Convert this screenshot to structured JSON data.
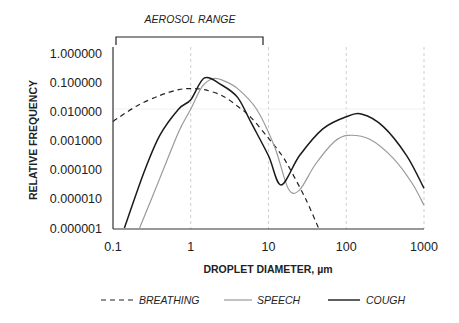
{
  "chart_data": {
    "type": "line",
    "title": "",
    "annotation": "AEROSOL RANGE",
    "annotation_range": [
      0.1,
      10
    ],
    "xlabel": "DROPLET DIAMETER,  µm",
    "ylabel": "RELATIVE FREQUENCY",
    "xscale": "log",
    "yscale": "log",
    "xlim": [
      0.1,
      1000
    ],
    "ylim": [
      1e-06,
      1
    ],
    "x_ticks": [
      0.1,
      1,
      10,
      100,
      1000
    ],
    "x_tick_labels": [
      "0.1",
      "1",
      "10",
      "100",
      "1000"
    ],
    "y_ticks": [
      1,
      0.1,
      0.01,
      0.001,
      0.0001,
      1e-05,
      1e-06
    ],
    "y_tick_labels": [
      "1.000000",
      "0.100000",
      "0.010000",
      "0.001000",
      "0.000100",
      "0.000010",
      "0.000001"
    ],
    "grid": "vertical dashed at decades",
    "legend_position": "bottom",
    "series": [
      {
        "name": "BREATHING",
        "style": "dashed",
        "color": "#222222",
        "points": [
          [
            0.1,
            0.0045
          ],
          [
            0.2,
            0.015
          ],
          [
            0.4,
            0.035
          ],
          [
            0.7,
            0.055
          ],
          [
            1.0,
            0.06
          ],
          [
            1.5,
            0.055
          ],
          [
            2.5,
            0.035
          ],
          [
            4,
            0.015
          ],
          [
            6,
            0.006
          ],
          [
            10,
            0.0012
          ],
          [
            15,
            0.0003
          ],
          [
            20,
            8e-05
          ],
          [
            30,
            1e-05
          ],
          [
            44,
            1e-06
          ]
        ]
      },
      {
        "name": "SPEECH",
        "style": "solid",
        "color": "#9a9a9a",
        "points": [
          [
            0.22,
            1e-06
          ],
          [
            0.4,
            5e-05
          ],
          [
            0.7,
            0.002
          ],
          [
            1.0,
            0.012
          ],
          [
            1.4,
            0.07
          ],
          [
            1.9,
            0.13
          ],
          [
            2.5,
            0.12
          ],
          [
            4,
            0.06
          ],
          [
            7,
            0.012
          ],
          [
            12,
            0.0006
          ],
          [
            18,
            2.2e-05
          ],
          [
            25,
            2e-05
          ],
          [
            40,
            0.00015
          ],
          [
            70,
            0.0009
          ],
          [
            105,
            0.0015
          ],
          [
            200,
            0.0011
          ],
          [
            400,
            0.00025
          ],
          [
            700,
            3.5e-05
          ],
          [
            1000,
            6e-06
          ]
        ]
      },
      {
        "name": "COUGH",
        "style": "solid",
        "color": "#1a1a1a",
        "points": [
          [
            0.14,
            1e-06
          ],
          [
            0.25,
            8e-05
          ],
          [
            0.4,
            0.0015
          ],
          [
            0.7,
            0.012
          ],
          [
            1.0,
            0.025
          ],
          [
            1.5,
            0.14
          ],
          [
            2.5,
            0.08
          ],
          [
            4,
            0.03
          ],
          [
            6,
            0.004
          ],
          [
            10,
            0.0003
          ],
          [
            14.5,
            3e-05
          ],
          [
            25,
            0.0003
          ],
          [
            50,
            0.0025
          ],
          [
            100,
            0.0065
          ],
          [
            160,
            0.008
          ],
          [
            300,
            0.003
          ],
          [
            600,
            0.0003
          ],
          [
            1000,
            2.3e-05
          ]
        ]
      }
    ]
  },
  "legend": [
    {
      "label": "BREATHING",
      "style": "dashed"
    },
    {
      "label": "SPEECH",
      "style": "solid-gray"
    },
    {
      "label": "COUGH",
      "style": "solid-black"
    }
  ]
}
